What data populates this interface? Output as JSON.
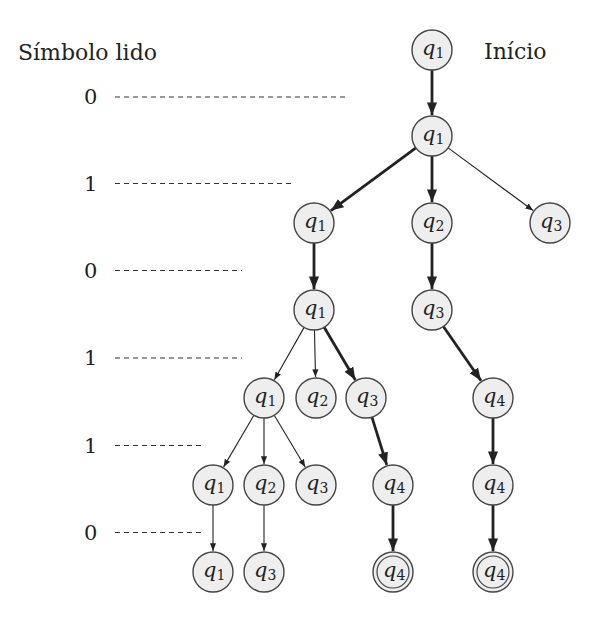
{
  "header": {
    "symbol_label": "Símbolo lido",
    "start_label": "Início"
  },
  "symbols": [
    "0",
    "1",
    "0",
    "1",
    "1",
    "0"
  ],
  "nodes": [
    {
      "id": "n0",
      "state": "1",
      "level": 0,
      "col": 4,
      "final": false
    },
    {
      "id": "n1",
      "state": "1",
      "level": 1,
      "col": 4,
      "final": false
    },
    {
      "id": "n2",
      "state": "1",
      "level": 2,
      "col": 2,
      "final": false
    },
    {
      "id": "n3",
      "state": "2",
      "level": 2,
      "col": 4,
      "final": false
    },
    {
      "id": "n4",
      "state": "3",
      "level": 2,
      "col": 6,
      "final": false
    },
    {
      "id": "n5",
      "state": "1",
      "level": 3,
      "col": 2,
      "final": false
    },
    {
      "id": "n6",
      "state": "3",
      "level": 3,
      "col": 4,
      "final": false
    },
    {
      "id": "n7",
      "state": "1",
      "level": 4,
      "col": 1,
      "final": false
    },
    {
      "id": "n8",
      "state": "2",
      "level": 4,
      "col": 2,
      "final": false
    },
    {
      "id": "n9",
      "state": "3",
      "level": 4,
      "col": 3,
      "final": false
    },
    {
      "id": "n10",
      "state": "4",
      "level": 4,
      "col": 5,
      "final": false
    },
    {
      "id": "n11",
      "state": "1",
      "level": 5,
      "col": 0,
      "final": false
    },
    {
      "id": "n12",
      "state": "2",
      "level": 5,
      "col": 1,
      "final": false
    },
    {
      "id": "n13",
      "state": "3",
      "level": 5,
      "col": 2,
      "final": false
    },
    {
      "id": "n14",
      "state": "4",
      "level": 5,
      "col": 3.5,
      "final": false
    },
    {
      "id": "n15",
      "state": "4",
      "level": 5,
      "col": 5,
      "final": false
    },
    {
      "id": "n16",
      "state": "1",
      "level": 6,
      "col": 0,
      "final": false
    },
    {
      "id": "n17",
      "state": "3",
      "level": 6,
      "col": 1,
      "final": false
    },
    {
      "id": "n18",
      "state": "4",
      "level": 6,
      "col": 3.5,
      "final": true
    },
    {
      "id": "n19",
      "state": "4",
      "level": 6,
      "col": 5,
      "final": true
    }
  ],
  "edges": [
    {
      "from": "n0",
      "to": "n1",
      "accepting_path": true
    },
    {
      "from": "n1",
      "to": "n2",
      "accepting_path": true
    },
    {
      "from": "n1",
      "to": "n3",
      "accepting_path": true
    },
    {
      "from": "n1",
      "to": "n4",
      "accepting_path": false
    },
    {
      "from": "n2",
      "to": "n5",
      "accepting_path": true
    },
    {
      "from": "n3",
      "to": "n6",
      "accepting_path": true
    },
    {
      "from": "n5",
      "to": "n7",
      "accepting_path": false
    },
    {
      "from": "n5",
      "to": "n8",
      "accepting_path": false
    },
    {
      "from": "n5",
      "to": "n9",
      "accepting_path": true
    },
    {
      "from": "n6",
      "to": "n10",
      "accepting_path": true
    },
    {
      "from": "n7",
      "to": "n11",
      "accepting_path": false
    },
    {
      "from": "n7",
      "to": "n12",
      "accepting_path": false
    },
    {
      "from": "n7",
      "to": "n13",
      "accepting_path": false
    },
    {
      "from": "n9",
      "to": "n14",
      "accepting_path": true
    },
    {
      "from": "n10",
      "to": "n15",
      "accepting_path": true
    },
    {
      "from": "n11",
      "to": "n16",
      "accepting_path": false
    },
    {
      "from": "n12",
      "to": "n17",
      "accepting_path": false
    },
    {
      "from": "n14",
      "to": "n18",
      "accepting_path": true
    },
    {
      "from": "n15",
      "to": "n19",
      "accepting_path": true
    }
  ],
  "colors": {
    "node_fill": "#eeeeee",
    "stroke": "#222222"
  }
}
